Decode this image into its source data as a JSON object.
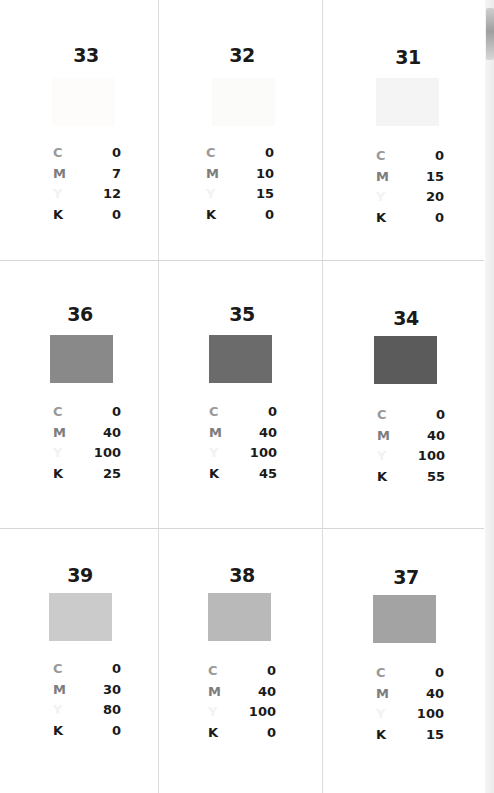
{
  "labels": {
    "c": "C",
    "m": "M",
    "y": "Y",
    "k": "K"
  },
  "cards": [
    {
      "number": "33",
      "c": "0",
      "m": "7",
      "y": "12",
      "k": "0",
      "swatch": "#fdfcfa"
    },
    {
      "number": "32",
      "c": "0",
      "m": "10",
      "y": "15",
      "k": "0",
      "swatch": "#fbfbfa"
    },
    {
      "number": "31",
      "c": "0",
      "m": "15",
      "y": "20",
      "k": "0",
      "swatch": "#f4f4f4"
    },
    {
      "number": "36",
      "c": "0",
      "m": "40",
      "y": "100",
      "k": "25",
      "swatch": "#898989"
    },
    {
      "number": "35",
      "c": "0",
      "m": "40",
      "y": "100",
      "k": "45",
      "swatch": "#6b6b6b"
    },
    {
      "number": "34",
      "c": "0",
      "m": "40",
      "y": "100",
      "k": "55",
      "swatch": "#5b5b5b"
    },
    {
      "number": "39",
      "c": "0",
      "m": "30",
      "y": "80",
      "k": "0",
      "swatch": "#cbcbcb"
    },
    {
      "number": "38",
      "c": "0",
      "m": "40",
      "y": "100",
      "k": "0",
      "swatch": "#b9b9b9"
    },
    {
      "number": "37",
      "c": "0",
      "m": "40",
      "y": "100",
      "k": "15",
      "swatch": "#a3a3a3"
    }
  ]
}
